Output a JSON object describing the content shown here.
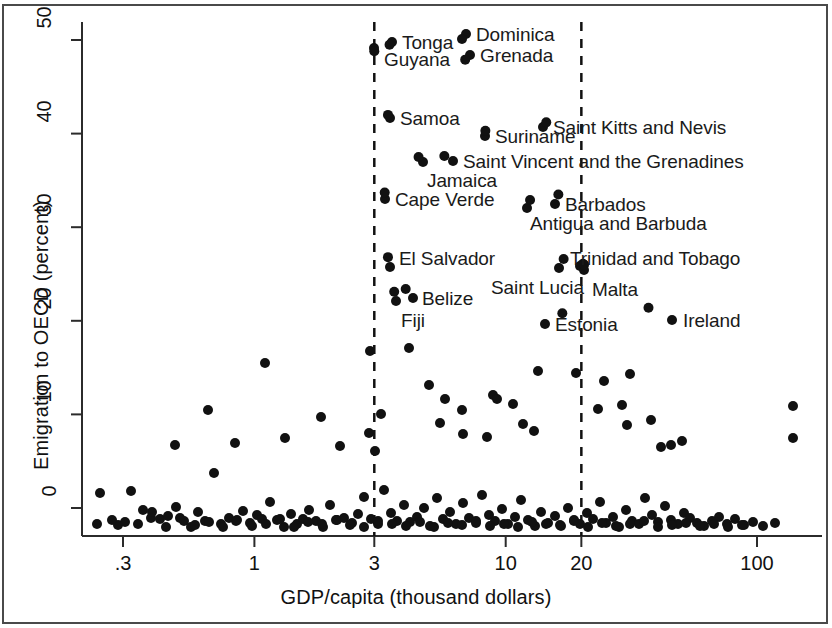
{
  "chart_data": {
    "type": "scatter",
    "title": "",
    "xlabel": "GDP/capita (thousand dollars)",
    "ylabel": "Emigration to OECD (percent)",
    "x_scale": "log",
    "xlim": [
      0.22,
      180
    ],
    "ylim": [
      -1.5,
      52
    ],
    "xticks": [
      0.3,
      1,
      3,
      10,
      20,
      100
    ],
    "xtick_labels": [
      ".3",
      "1",
      "3",
      "10",
      "20",
      "100"
    ],
    "yticks": [
      0,
      10,
      20,
      30,
      40,
      50
    ],
    "ytick_labels": [
      "0",
      "10",
      "20",
      "30",
      "40",
      "50"
    ],
    "grid": false,
    "legend": null,
    "reference_lines": [
      {
        "type": "vertical",
        "value": 3,
        "style": "dashed"
      },
      {
        "type": "vertical",
        "value": 20,
        "style": "dashed"
      }
    ],
    "marker": {
      "shape": "circle",
      "color": "#111111",
      "size": 9
    },
    "labeled_points": [
      {
        "name": "Guyana",
        "x": 3.0,
        "y": 48.8,
        "label": "Guyana",
        "lx": 384,
        "ly": 49,
        "anchor": "start"
      },
      {
        "name": "Tonga",
        "x": 3.45,
        "y": 49.5,
        "label": "Tonga",
        "lx": 402,
        "ly": 32,
        "anchor": "start"
      },
      {
        "name": "Dominica",
        "x": 6.7,
        "y": 50.1,
        "label": "Dominica",
        "lx": 476,
        "ly": 24,
        "anchor": "start"
      },
      {
        "name": "Grenada",
        "x": 6.9,
        "y": 47.9,
        "label": "Grenada",
        "lx": 480,
        "ly": 45,
        "anchor": "start"
      },
      {
        "name": "Samoa",
        "x": 3.4,
        "y": 42.0,
        "label": "Samoa",
        "lx": 400,
        "ly": 108,
        "anchor": "start"
      },
      {
        "name": "Saint Kitts and Nevis",
        "x": 14.5,
        "y": 41.2,
        "label": "Saint Kitts and Nevis",
        "lx": 553,
        "ly": 117,
        "anchor": "start"
      },
      {
        "name": "Suriname",
        "x": 8.3,
        "y": 40.3,
        "label": "Suriname",
        "lx": 495,
        "ly": 126,
        "anchor": "start"
      },
      {
        "name": "Jamaica",
        "x": 4.5,
        "y": 37.5,
        "label": "Jamaica",
        "lx": 427,
        "ly": 170,
        "anchor": "start"
      },
      {
        "name": "Saint Vincent and the Grenadines",
        "x": 5.7,
        "y": 37.6,
        "label": "Saint Vincent and the Grenadines",
        "lx": 463,
        "ly": 151,
        "anchor": "start"
      },
      {
        "name": "Cape Verde",
        "x": 3.3,
        "y": 33.7,
        "label": "Cape Verde",
        "lx": 395,
        "ly": 189,
        "anchor": "start"
      },
      {
        "name": "Barbados",
        "x": 16.2,
        "y": 33.5,
        "label": "Barbados",
        "lx": 565,
        "ly": 194,
        "anchor": "start"
      },
      {
        "name": "Antigua and Barbuda",
        "x": 12.5,
        "y": 32.9,
        "label": "Antigua and Barbuda",
        "lx": 530,
        "ly": 213,
        "anchor": "start"
      },
      {
        "name": "El Salvador",
        "x": 3.4,
        "y": 26.8,
        "label": "El Salvador",
        "lx": 399,
        "ly": 248,
        "anchor": "start"
      },
      {
        "name": "Trinidad and Tobago",
        "x": 20.3,
        "y": 26.1,
        "label": "Trinidad and Tobago",
        "lx": 570,
        "ly": 248,
        "anchor": "start"
      },
      {
        "name": "Saint Lucia",
        "x": 17.0,
        "y": 26.6,
        "label": "Saint Lucia",
        "lx": 491,
        "ly": 277,
        "anchor": "start"
      },
      {
        "name": "Malta",
        "x": 20.5,
        "y": 26.0,
        "label": "Malta",
        "lx": 592,
        "ly": 279,
        "anchor": "start"
      },
      {
        "name": "Belize",
        "x": 4.0,
        "y": 23.4,
        "label": "Belize",
        "lx": 422,
        "ly": 288,
        "anchor": "start"
      },
      {
        "name": "Fiji",
        "x": 3.6,
        "y": 23.1,
        "label": "Fiji",
        "lx": 401,
        "ly": 310,
        "anchor": "start"
      },
      {
        "name": "Estonia",
        "x": 16.8,
        "y": 20.8,
        "label": "Estonia",
        "lx": 555,
        "ly": 314,
        "anchor": "start"
      },
      {
        "name": "Ireland",
        "x": 37.0,
        "y": 21.4,
        "label": "Ireland",
        "lx": 683,
        "ly": 310,
        "anchor": "start"
      }
    ],
    "points_px": [
      [
        374,
        48
      ],
      [
        392,
        42
      ],
      [
        466,
        34
      ],
      [
        470,
        55
      ],
      [
        390,
        118
      ],
      [
        543,
        127
      ],
      [
        485,
        136
      ],
      [
        423,
        162
      ],
      [
        453,
        161
      ],
      [
        385,
        199
      ],
      [
        555,
        204
      ],
      [
        527,
        208
      ],
      [
        390,
        267
      ],
      [
        580,
        266
      ],
      [
        559,
        268
      ],
      [
        584,
        270
      ],
      [
        413,
        298
      ],
      [
        396,
        301
      ],
      [
        545,
        324
      ],
      [
        672,
        320
      ],
      [
        370,
        351
      ],
      [
        409,
        348
      ],
      [
        265,
        363
      ],
      [
        429,
        385
      ],
      [
        493,
        395
      ],
      [
        538,
        371
      ],
      [
        576,
        373
      ],
      [
        604,
        381
      ],
      [
        630,
        374
      ],
      [
        381,
        414
      ],
      [
        208,
        410
      ],
      [
        321,
        417
      ],
      [
        445,
        399
      ],
      [
        462,
        410
      ],
      [
        497,
        399
      ],
      [
        513,
        404
      ],
      [
        598,
        409
      ],
      [
        622,
        405
      ],
      [
        369,
        433
      ],
      [
        375,
        451
      ],
      [
        440,
        423
      ],
      [
        463,
        434
      ],
      [
        487,
        437
      ],
      [
        523,
        424
      ],
      [
        534,
        431
      ],
      [
        627,
        425
      ],
      [
        651,
        420
      ],
      [
        285,
        438
      ],
      [
        340,
        446
      ],
      [
        235,
        443
      ],
      [
        175,
        445
      ],
      [
        661,
        447
      ],
      [
        671,
        445
      ],
      [
        682,
        441
      ],
      [
        97,
        524
      ],
      [
        118,
        525
      ],
      [
        131,
        491
      ],
      [
        143,
        510
      ],
      [
        151,
        518
      ],
      [
        160,
        519
      ],
      [
        168,
        516
      ],
      [
        176,
        507
      ],
      [
        184,
        521
      ],
      [
        191,
        527
      ],
      [
        198,
        512
      ],
      [
        205,
        521
      ],
      [
        214,
        473
      ],
      [
        221,
        524
      ],
      [
        229,
        518
      ],
      [
        236,
        521
      ],
      [
        243,
        511
      ],
      [
        250,
        523
      ],
      [
        257,
        515
      ],
      [
        262,
        519
      ],
      [
        270,
        502
      ],
      [
        277,
        520
      ],
      [
        284,
        527
      ],
      [
        291,
        514
      ],
      [
        297,
        524
      ],
      [
        303,
        519
      ],
      [
        309,
        510
      ],
      [
        316,
        521
      ],
      [
        323,
        527
      ],
      [
        330,
        505
      ],
      [
        337,
        520
      ],
      [
        344,
        518
      ],
      [
        352,
        523
      ],
      [
        358,
        514
      ],
      [
        364,
        497
      ],
      [
        371,
        519
      ],
      [
        378,
        524
      ],
      [
        384,
        490
      ],
      [
        391,
        513
      ],
      [
        397,
        521
      ],
      [
        404,
        505
      ],
      [
        410,
        522
      ],
      [
        417,
        517
      ],
      [
        424,
        508
      ],
      [
        430,
        526
      ],
      [
        437,
        498
      ],
      [
        443,
        519
      ],
      [
        450,
        512
      ],
      [
        456,
        524
      ],
      [
        463,
        503
      ],
      [
        469,
        518
      ],
      [
        476,
        523
      ],
      [
        482,
        495
      ],
      [
        489,
        515
      ],
      [
        495,
        521
      ],
      [
        502,
        509
      ],
      [
        508,
        524
      ],
      [
        515,
        517
      ],
      [
        521,
        500
      ],
      [
        528,
        520
      ],
      [
        535,
        526
      ],
      [
        541,
        512
      ],
      [
        548,
        523
      ],
      [
        555,
        516
      ],
      [
        561,
        526
      ],
      [
        568,
        508
      ],
      [
        574,
        521
      ],
      [
        580,
        524
      ],
      [
        587,
        513
      ],
      [
        593,
        519
      ],
      [
        600,
        502
      ],
      [
        606,
        523
      ],
      [
        613,
        517
      ],
      [
        619,
        527
      ],
      [
        626,
        510
      ],
      [
        632,
        521
      ],
      [
        639,
        524
      ],
      [
        645,
        498
      ],
      [
        652,
        515
      ],
      [
        658,
        522
      ],
      [
        665,
        506
      ],
      [
        671,
        520
      ],
      [
        678,
        524
      ],
      [
        684,
        513
      ],
      [
        690,
        518
      ],
      [
        697,
        523
      ],
      [
        704,
        526
      ],
      [
        712,
        521
      ],
      [
        719,
        517
      ],
      [
        727,
        524
      ],
      [
        735,
        519
      ],
      [
        744,
        525
      ],
      [
        753,
        522
      ],
      [
        763,
        526
      ],
      [
        775,
        523
      ],
      [
        793,
        406
      ],
      [
        793,
        438
      ],
      [
        100,
        493
      ],
      [
        112,
        520
      ],
      [
        125,
        522
      ],
      [
        138,
        524
      ],
      [
        152,
        512
      ],
      [
        166,
        527
      ],
      [
        180,
        518
      ],
      [
        195,
        525
      ],
      [
        209,
        522
      ],
      [
        223,
        527
      ],
      [
        237,
        520
      ],
      [
        252,
        526
      ],
      [
        266,
        524
      ],
      [
        280,
        519
      ],
      [
        294,
        527
      ],
      [
        308,
        522
      ],
      [
        322,
        524
      ],
      [
        336,
        520
      ],
      [
        350,
        525
      ],
      [
        364,
        527
      ],
      [
        378,
        521
      ],
      [
        392,
        524
      ],
      [
        406,
        526
      ],
      [
        420,
        522
      ],
      [
        434,
        527
      ],
      [
        448,
        523
      ],
      [
        462,
        525
      ],
      [
        476,
        521
      ],
      [
        490,
        526
      ],
      [
        504,
        524
      ],
      [
        518,
        527
      ],
      [
        532,
        522
      ],
      [
        546,
        524
      ],
      [
        560,
        525
      ],
      [
        574,
        520
      ],
      [
        588,
        527
      ],
      [
        602,
        523
      ],
      [
        616,
        526
      ],
      [
        630,
        524
      ],
      [
        644,
        521
      ],
      [
        658,
        527
      ],
      [
        672,
        525
      ],
      [
        686,
        523
      ],
      [
        700,
        526
      ],
      [
        714,
        524
      ],
      [
        728,
        527
      ],
      [
        742,
        525
      ]
    ]
  },
  "figure": {
    "frame_color": "#4a4a4a",
    "background": "#ffffff",
    "marker_color": "#111111",
    "text_color": "#111111"
  }
}
